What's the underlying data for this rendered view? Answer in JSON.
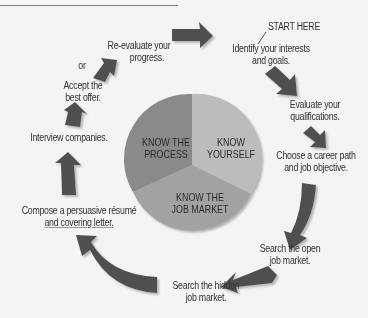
{
  "diagram": {
    "type": "career-planning-cycle",
    "start_label": "START HERE",
    "steps": [
      {
        "order": 1,
        "text_line1": "Identify your interests",
        "text_line2": "and goals."
      },
      {
        "order": 2,
        "text_line1": "Evaluate your",
        "text_line2": "qualifications."
      },
      {
        "order": 3,
        "text_line1": "Choose a career path",
        "text_line2": "and job objective."
      },
      {
        "order": 4,
        "text_line1": "Search the open",
        "text_line2": "job market."
      },
      {
        "order": 5,
        "text_line1": "Search the hidden",
        "text_line2": "job market."
      },
      {
        "order": 6,
        "text_line1": "Compose a persuasive résumé",
        "text_line2": "and covering letter."
      },
      {
        "order": 7,
        "text_line1": "Interview companies.",
        "text_line2": ""
      },
      {
        "order": 8,
        "text_line1": "Accept the",
        "text_line2": "best offer."
      },
      {
        "order": 9,
        "text_line1": "Re-evaluate your",
        "text_line2": "progress."
      }
    ],
    "or_label": "or",
    "center_pie": {
      "segments": [
        {
          "line1": "KNOW THE",
          "line2": "PROCESS",
          "color": "#8a8a8a"
        },
        {
          "line1": "KNOW",
          "line2": "YOURSELF",
          "color": "#b9b9b9"
        },
        {
          "line1": "KNOW THE",
          "line2": "JOB MARKET",
          "color": "#a0a0a0"
        }
      ]
    },
    "colors": {
      "arrow": "#505050",
      "arrow_shadow": "#b8b8b8",
      "background": "#f4f4f2"
    }
  }
}
